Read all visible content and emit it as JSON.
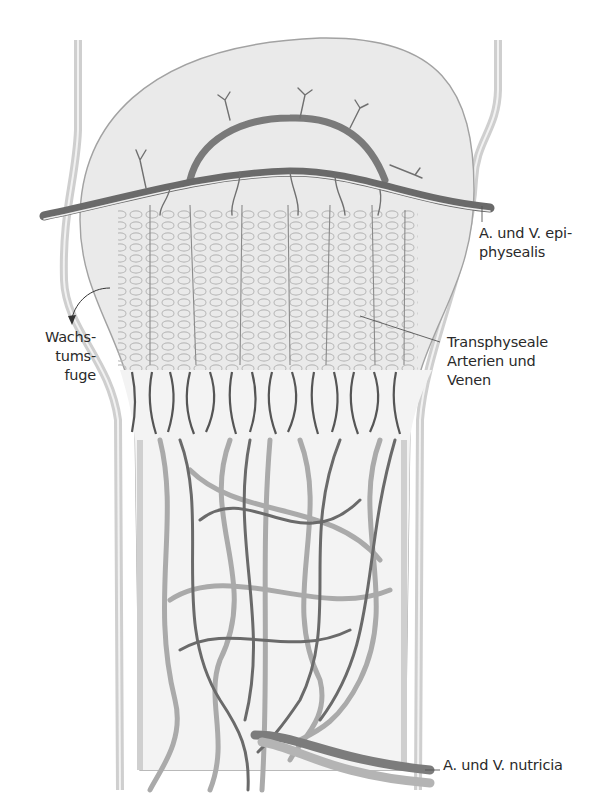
{
  "figure": {
    "colors": {
      "background": "#ffffff",
      "bone_fill": "#ececec",
      "bone_outline": "#9a9a9a",
      "periosteum": "#d4d4d4",
      "artery": "#6e6e6e",
      "vein": "#a8a8a8",
      "cartilage_cells": "#bdbdbd",
      "label_text": "#2a2a2a"
    }
  },
  "labels": {
    "epiphysealis": {
      "line1": "A. und V. epi-",
      "line2": "physealis"
    },
    "wachstumsfuge": {
      "line1": "Wachs-",
      "line2": "tums-",
      "line3": "fuge"
    },
    "transphyseale": {
      "line1": "Transphyseale",
      "line2": "Arterien und",
      "line3": "Venen"
    },
    "nutricia": {
      "line1": "A. und V. nutricia"
    }
  }
}
